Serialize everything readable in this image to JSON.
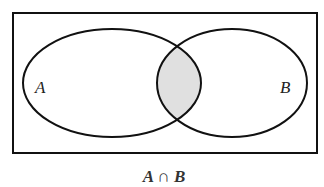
{
  "diagram": {
    "type": "venn",
    "universe": "rectangle",
    "sets": [
      {
        "label": "A"
      },
      {
        "label": "B"
      }
    ],
    "shaded_region": "A ∩ B",
    "caption": "A ∩ B",
    "colors": {
      "stroke": "#111111",
      "shade": "#e0e0e0",
      "background": "#ffffff"
    }
  }
}
